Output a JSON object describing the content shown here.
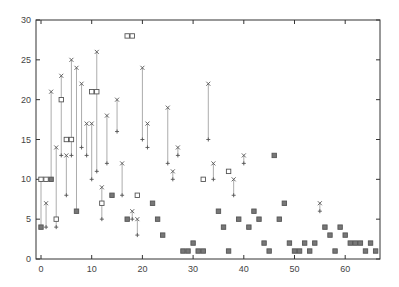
{
  "chart_data": {
    "type": "scatter",
    "title": "",
    "xlabel": "",
    "ylabel": "",
    "xlim": [
      -1,
      67
    ],
    "ylim": [
      0,
      30
    ],
    "grid": false,
    "legend": null,
    "xticks": [
      0,
      10,
      20,
      30,
      40,
      50,
      60
    ],
    "yticks": [
      0,
      5,
      10,
      15,
      20,
      25,
      30
    ],
    "ranges": [
      {
        "x": 0,
        "high": 10,
        "low": 4
      },
      {
        "x": 1,
        "high": 7,
        "low": 4
      },
      {
        "x": 2,
        "high": 21,
        "low": 10
      },
      {
        "x": 3,
        "high": 14,
        "low": 4
      },
      {
        "x": 4,
        "high": 23,
        "low": 13
      },
      {
        "x": 5,
        "high": 13,
        "low": 8
      },
      {
        "x": 6,
        "high": 25,
        "low": 13
      },
      {
        "x": 7,
        "high": 24,
        "low": 6
      },
      {
        "x": 8,
        "high": 22,
        "low": 14
      },
      {
        "x": 9,
        "high": 17,
        "low": 13
      },
      {
        "x": 10,
        "high": 17,
        "low": 10
      },
      {
        "x": 11,
        "high": 26,
        "low": 11
      },
      {
        "x": 12,
        "high": 9,
        "low": 5
      },
      {
        "x": 13,
        "high": 18,
        "low": 12
      },
      {
        "x": 15,
        "high": 20,
        "low": 16
      },
      {
        "x": 16,
        "high": 12,
        "low": 8
      },
      {
        "x": 18,
        "high": 6,
        "low": 5
      },
      {
        "x": 19,
        "high": 5,
        "low": 3
      },
      {
        "x": 20,
        "high": 24,
        "low": 15
      },
      {
        "x": 21,
        "high": 17,
        "low": 14
      },
      {
        "x": 25,
        "high": 19,
        "low": 12
      },
      {
        "x": 26,
        "high": 11,
        "low": 10
      },
      {
        "x": 27,
        "high": 14,
        "low": 13
      },
      {
        "x": 33,
        "high": 22,
        "low": 15
      },
      {
        "x": 34,
        "high": 12,
        "low": 10
      },
      {
        "x": 38,
        "high": 10,
        "low": 8
      },
      {
        "x": 40,
        "high": 13,
        "low": 12
      },
      {
        "x": 55,
        "high": 7,
        "low": 6
      }
    ],
    "open_squares": [
      {
        "x": 0,
        "y": 10
      },
      {
        "x": 1,
        "y": 10
      },
      {
        "x": 3,
        "y": 5
      },
      {
        "x": 4,
        "y": 20
      },
      {
        "x": 5,
        "y": 15
      },
      {
        "x": 6,
        "y": 15
      },
      {
        "x": 10,
        "y": 21
      },
      {
        "x": 11,
        "y": 21
      },
      {
        "x": 12,
        "y": 7
      },
      {
        "x": 17,
        "y": 28
      },
      {
        "x": 18,
        "y": 28
      },
      {
        "x": 19,
        "y": 8
      },
      {
        "x": 32,
        "y": 10
      },
      {
        "x": 37,
        "y": 11
      }
    ],
    "filled_squares": [
      {
        "x": 0,
        "y": 4
      },
      {
        "x": 2,
        "y": 10
      },
      {
        "x": 7,
        "y": 6
      },
      {
        "x": 14,
        "y": 8
      },
      {
        "x": 17,
        "y": 5
      },
      {
        "x": 22,
        "y": 7
      },
      {
        "x": 23,
        "y": 5
      },
      {
        "x": 24,
        "y": 3
      },
      {
        "x": 28,
        "y": 1
      },
      {
        "x": 29,
        "y": 1
      },
      {
        "x": 30,
        "y": 2
      },
      {
        "x": 31,
        "y": 1
      },
      {
        "x": 32,
        "y": 1
      },
      {
        "x": 35,
        "y": 6
      },
      {
        "x": 36,
        "y": 4
      },
      {
        "x": 37,
        "y": 1
      },
      {
        "x": 39,
        "y": 5
      },
      {
        "x": 41,
        "y": 4
      },
      {
        "x": 42,
        "y": 6
      },
      {
        "x": 43,
        "y": 5
      },
      {
        "x": 44,
        "y": 2
      },
      {
        "x": 45,
        "y": 1
      },
      {
        "x": 46,
        "y": 13
      },
      {
        "x": 47,
        "y": 5
      },
      {
        "x": 48,
        "y": 7
      },
      {
        "x": 49,
        "y": 2
      },
      {
        "x": 50,
        "y": 1
      },
      {
        "x": 51,
        "y": 1
      },
      {
        "x": 52,
        "y": 2
      },
      {
        "x": 53,
        "y": 1
      },
      {
        "x": 54,
        "y": 2
      },
      {
        "x": 56,
        "y": 4
      },
      {
        "x": 57,
        "y": 3
      },
      {
        "x": 58,
        "y": 1
      },
      {
        "x": 59,
        "y": 4
      },
      {
        "x": 60,
        "y": 3
      },
      {
        "x": 61,
        "y": 2
      },
      {
        "x": 62,
        "y": 2
      },
      {
        "x": 63,
        "y": 2
      },
      {
        "x": 64,
        "y": 1
      },
      {
        "x": 65,
        "y": 2
      },
      {
        "x": 66,
        "y": 1
      }
    ]
  },
  "colors": {
    "axis": "#333333",
    "marker": "#555555",
    "line": "#888888"
  }
}
